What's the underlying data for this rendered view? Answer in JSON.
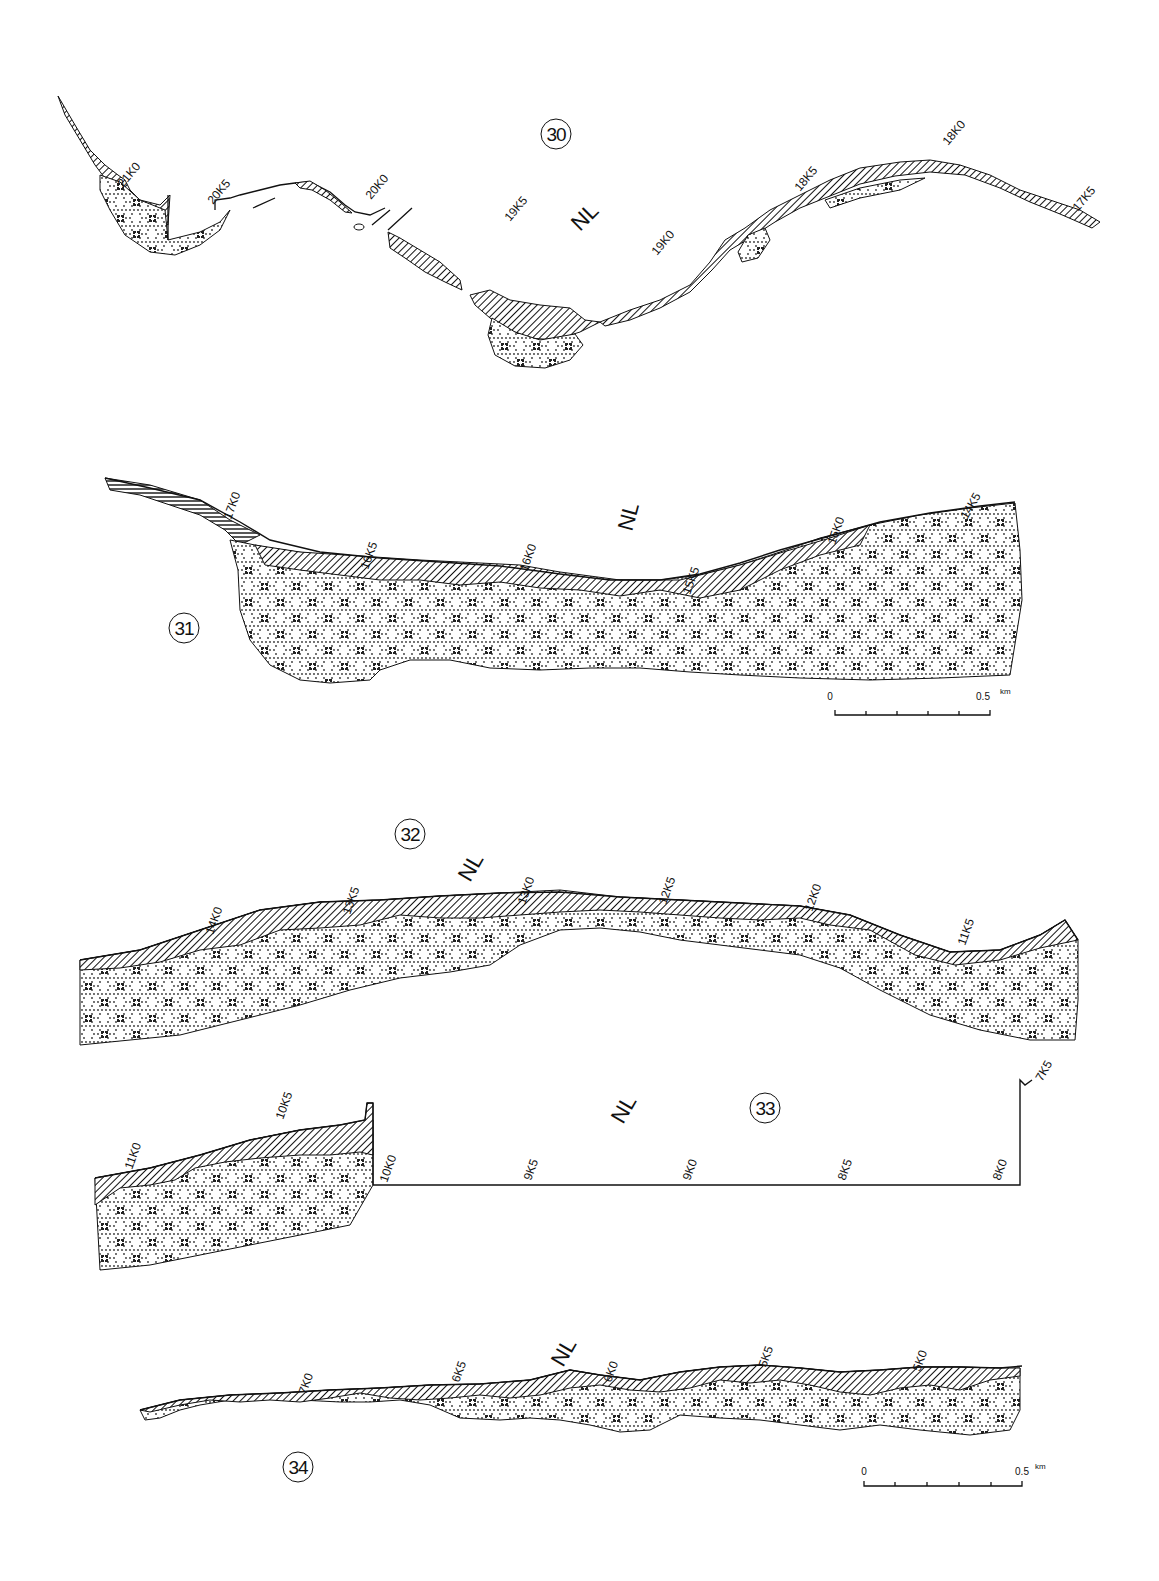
{
  "plate": {
    "unit_label": "km",
    "colors": {
      "ink": "#111111",
      "paper": "#ffffff"
    }
  },
  "panels": [
    {
      "id": "30",
      "number": "30",
      "nl_label": "NL",
      "km_markers": [
        "21K0",
        "20K5",
        "20K0",
        "19K5",
        "19K0",
        "18K5",
        "18K0",
        "17K5"
      ]
    },
    {
      "id": "31",
      "number": "31",
      "nl_label": "NL",
      "km_markers": [
        "17K0",
        "16K5",
        "16K0",
        "15K5",
        "15K0",
        "14K5"
      ]
    },
    {
      "id": "32",
      "number": "32",
      "nl_label": "NL",
      "km_markers": [
        "14K0",
        "13K5",
        "13K0",
        "12K5",
        "12K0",
        "11K5"
      ]
    },
    {
      "id": "33",
      "number": "33",
      "nl_label": "NL",
      "km_markers": [
        "11K0",
        "10K5",
        "10K0",
        "9K5",
        "9K0",
        "8K5",
        "8K0",
        "7K5"
      ]
    },
    {
      "id": "34",
      "number": "34",
      "nl_label": "NL",
      "km_markers": [
        "7K0",
        "6K5",
        "6K0",
        "5K5",
        "5K0"
      ]
    }
  ],
  "scale_bars": [
    {
      "id": "scale-1",
      "start": "0",
      "end": "0.5",
      "unit": "km"
    },
    {
      "id": "scale-2",
      "start": "0",
      "end": "0.5",
      "unit": "km"
    }
  ],
  "legend_patterns": [
    {
      "name": "hatched",
      "icon": "diagonal-hatch-pattern"
    },
    {
      "name": "dotted-cross",
      "icon": "dot-cross-pattern"
    }
  ]
}
